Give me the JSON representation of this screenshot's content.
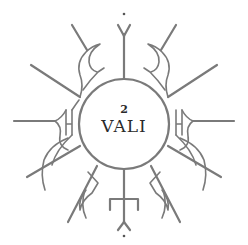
{
  "logo": {
    "numeral": "2",
    "name": "VALI",
    "stroke_color": "#7a7a7a",
    "text_color": "#2a2a2a",
    "background": "#ffffff"
  }
}
